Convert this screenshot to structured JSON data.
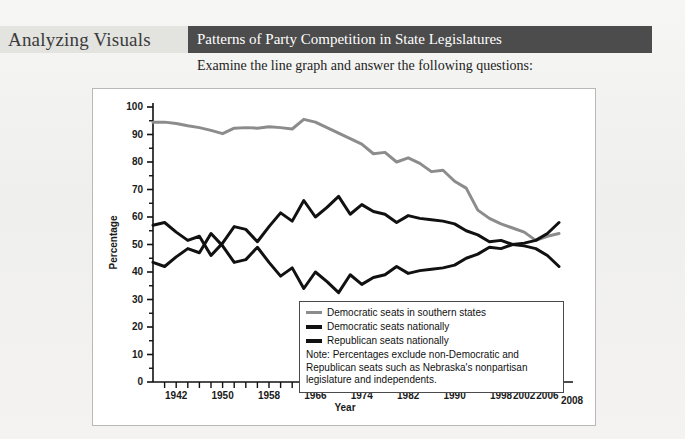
{
  "header": {
    "feature_label": "Analyzing Visuals",
    "title": "Patterns of Party Competition in State Legislatures",
    "subtitle": "Examine the line graph and answer the following questions:",
    "band_dark_color": "#4c4c4c",
    "band_light_color": "#e3e3e0"
  },
  "chart_data": {
    "type": "line",
    "title": "Patterns of Party Competition in State Legislatures",
    "xlabel": "Year",
    "ylabel": "Percentage",
    "ylim": [
      0,
      100
    ],
    "xlim": [
      1938,
      2008
    ],
    "grid": false,
    "legend_position": "inside-bottom-center",
    "ytick_labels": [
      "0",
      "10",
      "20",
      "30",
      "40",
      "50",
      "60",
      "70",
      "80",
      "90",
      "100"
    ],
    "ytick_values": [
      0,
      10,
      20,
      30,
      40,
      50,
      60,
      70,
      80,
      90,
      100
    ],
    "xtick_labels": [
      "1942",
      "1950",
      "1958",
      "1966",
      "1974",
      "1982",
      "1990",
      "1998",
      "2002",
      "2006"
    ],
    "xtick_values": [
      1942,
      1950,
      1958,
      1966,
      1974,
      1982,
      1990,
      1998,
      2002,
      2006
    ],
    "x_end_label": "2008",
    "x": [
      1938,
      1940,
      1942,
      1944,
      1946,
      1948,
      1950,
      1952,
      1954,
      1956,
      1958,
      1960,
      1962,
      1964,
      1966,
      1968,
      1970,
      1972,
      1974,
      1976,
      1978,
      1980,
      1982,
      1984,
      1986,
      1988,
      1990,
      1992,
      1994,
      1996,
      1998,
      2000,
      2002,
      2004,
      2006,
      2008
    ],
    "series": [
      {
        "name": "Democratic seats in southern states",
        "color": "#8c8c8c",
        "width": 3,
        "values": [
          94.5,
          94.5,
          94.0,
          93.2,
          92.5,
          91.5,
          90.3,
          92.3,
          92.5,
          92.3,
          92.8,
          92.5,
          92.0,
          95.5,
          94.5,
          92.5,
          90.5,
          88.5,
          86.5,
          83.0,
          83.5,
          80.0,
          81.5,
          79.5,
          76.5,
          77.0,
          73.0,
          70.5,
          62.5,
          59.5,
          57.5,
          56.0,
          54.5,
          51.5,
          53.0,
          54.0
        ]
      },
      {
        "name": "Democratic seats nationally",
        "color": "#111111",
        "width": 3,
        "values": [
          57.0,
          58.0,
          54.5,
          51.5,
          53.0,
          46.0,
          50.5,
          56.5,
          55.5,
          51.0,
          56.5,
          61.5,
          58.5,
          66.0,
          60.0,
          63.5,
          67.5,
          61.0,
          64.5,
          62.0,
          61.0,
          58.0,
          60.5,
          59.5,
          59.0,
          58.5,
          57.5,
          55.0,
          53.5,
          51.0,
          51.5,
          50.0,
          49.5,
          48.5,
          46.0,
          42.0
        ]
      },
      {
        "name": "Republican seats nationally",
        "color": "#111111",
        "width": 3,
        "values": [
          43.5,
          42.0,
          45.5,
          48.5,
          47.0,
          54.0,
          49.5,
          43.5,
          44.5,
          49.0,
          43.5,
          38.5,
          41.5,
          34.0,
          40.0,
          36.5,
          32.5,
          39.0,
          35.5,
          38.0,
          39.0,
          42.0,
          39.5,
          40.5,
          41.0,
          41.5,
          42.5,
          45.0,
          46.5,
          49.0,
          48.5,
          50.0,
          50.5,
          51.5,
          54.0,
          58.0
        ]
      }
    ],
    "note": "Note: Percentages exclude non-Democratic and Republican seats such as Nebraska's nonpartisan legislature and independents.",
    "note_lines": [
      "Note: Percentages exclude non-Democratic and",
      "Republican seats such as Nebraska's nonpartisan",
      "legislature and independents."
    ]
  }
}
